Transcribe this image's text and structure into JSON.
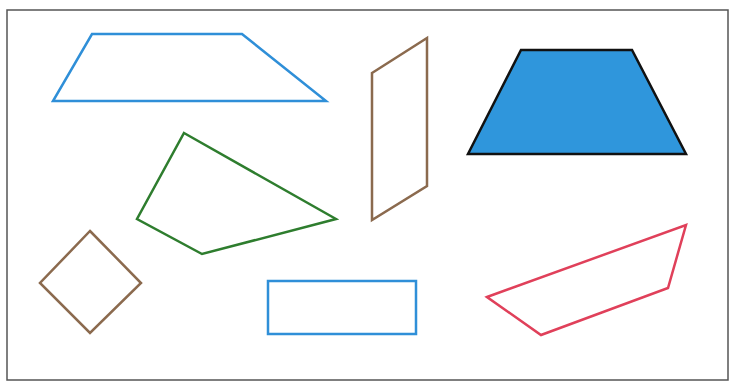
{
  "diagram": {
    "title": "",
    "background": "#ffffff",
    "frame": {
      "x": 7,
      "y": 10,
      "width": 721,
      "height": 370,
      "stroke": "#555555"
    },
    "shapes": [
      {
        "name": "blue-trapezoid-outline",
        "type": "trapezoid",
        "points": "92,34 242,34 326,101 53,101",
        "stroke": "#2f8fd8",
        "fill": "none",
        "stroke_width": 2.5
      },
      {
        "name": "green-quadrilateral",
        "type": "quadrilateral",
        "points": "184,133 336,219 202,254 137,219",
        "stroke": "#2e7d2e",
        "fill": "none",
        "stroke_width": 2.5
      },
      {
        "name": "brown-parallelogram",
        "type": "parallelogram",
        "points": "372,73 427,38 427,186 372,220",
        "stroke": "#8b6a4e",
        "fill": "none",
        "stroke_width": 2.5
      },
      {
        "name": "blue-filled-trapezoid",
        "type": "trapezoid",
        "points": "521,50 632,50 686,154 468,154",
        "stroke": "#111111",
        "fill": "#2f96dc",
        "stroke_width": 2.5
      },
      {
        "name": "brown-rhombus",
        "type": "rhombus",
        "points": "90,231 141,283 90,333 40,283",
        "stroke": "#8b6a4e",
        "fill": "none",
        "stroke_width": 2.5
      },
      {
        "name": "blue-rectangle",
        "type": "rectangle",
        "points": "268,281 416,281 416,334 268,334",
        "stroke": "#2f8fd8",
        "fill": "none",
        "stroke_width": 2.5
      },
      {
        "name": "red-quadrilateral",
        "type": "quadrilateral",
        "points": "487,297 686,225 668,288 541,335",
        "stroke": "#e0405a",
        "fill": "none",
        "stroke_width": 2.5
      }
    ]
  }
}
